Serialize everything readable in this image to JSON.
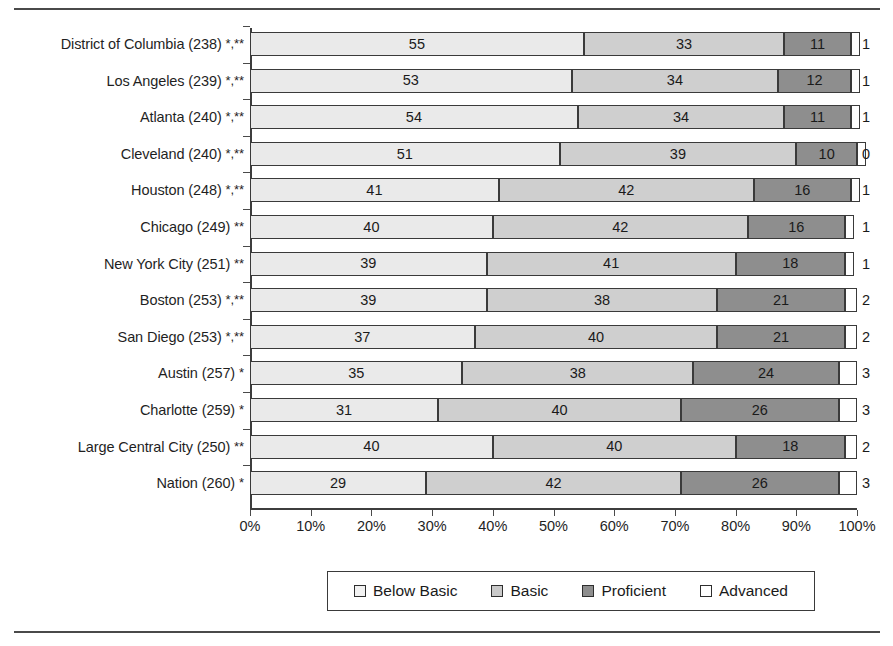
{
  "chart_data": {
    "type": "bar",
    "subtype": "stacked-horizontal-100percent",
    "title": "",
    "xlabel": "",
    "ylabel": "",
    "xlim": [
      0,
      100
    ],
    "grid": false,
    "legend_position": "bottom",
    "axis": {
      "tick_labels": [
        "0%",
        "10%",
        "20%",
        "30%",
        "40%",
        "50%",
        "60%",
        "70%",
        "80%",
        "90%",
        "100%"
      ],
      "tick_values": [
        0,
        10,
        20,
        30,
        40,
        50,
        60,
        70,
        80,
        90,
        100
      ]
    },
    "legend": [
      {
        "label": "Below Basic",
        "color": "#eaeaea",
        "key": "below"
      },
      {
        "label": "Basic",
        "color": "#cfcfcf",
        "key": "basic"
      },
      {
        "label": "Proficient",
        "color": "#8e8e8e",
        "key": "prof"
      },
      {
        "label": "Advanced",
        "color": "#ffffff",
        "key": "adv"
      }
    ],
    "series": [
      {
        "name": "Below Basic",
        "values": [
          55,
          53,
          54,
          51,
          41,
          40,
          39,
          39,
          37,
          35,
          31,
          40,
          29
        ]
      },
      {
        "name": "Basic",
        "values": [
          33,
          34,
          34,
          39,
          42,
          42,
          41,
          38,
          40,
          38,
          40,
          40,
          42
        ]
      },
      {
        "name": "Proficient",
        "values": [
          11,
          12,
          11,
          10,
          16,
          16,
          18,
          21,
          21,
          24,
          26,
          18,
          26
        ]
      },
      {
        "name": "Advanced",
        "values": [
          1,
          1,
          1,
          0,
          1,
          1,
          1,
          2,
          2,
          3,
          3,
          2,
          3
        ]
      }
    ],
    "categories": [
      "District of Columbia (238) *,**",
      "Los Angeles (239) *,**",
      "Atlanta (240) *,**",
      "Cleveland (240) *,**",
      "Houston (248) *,**",
      "Chicago (249) **",
      "New York City (251) **",
      "Boston (253) *,**",
      "San Diego (253) *,**",
      "Austin (257) *",
      "Charlotte (259) *",
      "Large Central City (250) **",
      "Nation (260) *"
    ],
    "rows": [
      {
        "name": "District of Columbia",
        "score": "238",
        "marks": "*,**",
        "below": 55,
        "basic": 33,
        "prof": 11,
        "adv": 1
      },
      {
        "name": "Los Angeles",
        "score": "239",
        "marks": "*,**",
        "below": 53,
        "basic": 34,
        "prof": 12,
        "adv": 1
      },
      {
        "name": "Atlanta",
        "score": "240",
        "marks": "*,**",
        "below": 54,
        "basic": 34,
        "prof": 11,
        "adv": 1
      },
      {
        "name": "Cleveland",
        "score": "240",
        "marks": "*,**",
        "below": 51,
        "basic": 39,
        "prof": 10,
        "adv": 0
      },
      {
        "name": "Houston",
        "score": "248",
        "marks": "*,**",
        "below": 41,
        "basic": 42,
        "prof": 16,
        "adv": 1
      },
      {
        "name": "Chicago",
        "score": "249",
        "marks": "**",
        "below": 40,
        "basic": 42,
        "prof": 16,
        "adv": 1
      },
      {
        "name": "New York City",
        "score": "251",
        "marks": "**",
        "below": 39,
        "basic": 41,
        "prof": 18,
        "adv": 1
      },
      {
        "name": "Boston",
        "score": "253",
        "marks": "*,**",
        "below": 39,
        "basic": 38,
        "prof": 21,
        "adv": 2
      },
      {
        "name": "San Diego",
        "score": "253",
        "marks": "*,**",
        "below": 37,
        "basic": 40,
        "prof": 21,
        "adv": 2
      },
      {
        "name": "Austin",
        "score": "257",
        "marks": "*",
        "below": 35,
        "basic": 38,
        "prof": 24,
        "adv": 3
      },
      {
        "name": "Charlotte",
        "score": "259",
        "marks": "*",
        "below": 31,
        "basic": 40,
        "prof": 26,
        "adv": 3
      },
      {
        "name": "Large Central City",
        "score": "250",
        "marks": "**",
        "below": 40,
        "basic": 40,
        "prof": 18,
        "adv": 2
      },
      {
        "name": "Nation",
        "score": "260",
        "marks": "*",
        "below": 29,
        "basic": 42,
        "prof": 26,
        "adv": 3
      }
    ]
  }
}
